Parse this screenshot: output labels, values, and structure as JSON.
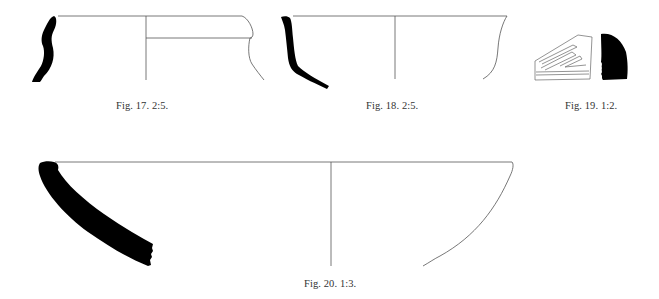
{
  "figures": [
    {
      "id": "fig17",
      "caption": "Fig. 17. 2:5.",
      "description": "Pottery rim sherd profile with reconstructed vessel outline (jar with everted rim)"
    },
    {
      "id": "fig18",
      "caption": "Fig. 18. 2:5.",
      "description": "Pottery sherd profile with reconstructed bowl outline"
    },
    {
      "id": "fig19",
      "caption": "Fig. 19. 1:2.",
      "description": "Decorated sherd with incised chevron pattern and black section profile"
    },
    {
      "id": "fig20",
      "caption": "Fig. 20. 1:3.",
      "description": "Large shallow bowl profile with reconstructed outline"
    }
  ],
  "colors": {
    "profile_fill": "#000000",
    "outline_stroke": "#555555",
    "background": "#ffffff"
  }
}
